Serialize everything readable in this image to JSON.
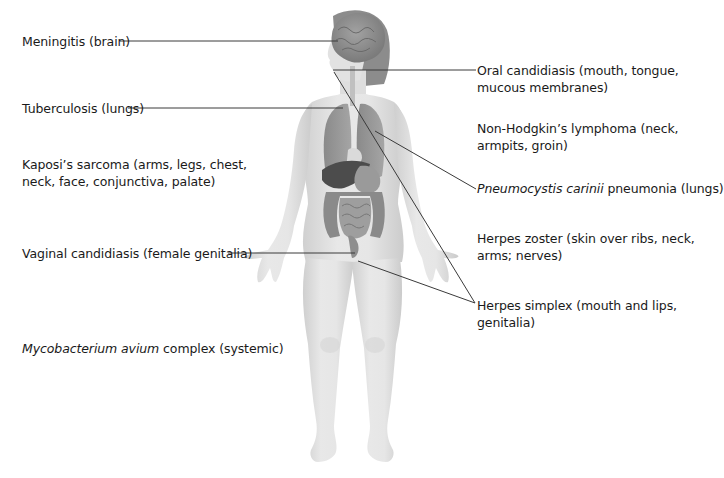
{
  "colors": {
    "background": "#ffffff",
    "text": "#1a1a1a",
    "leader_line": "#3a3a3a",
    "skin": "#e3e3e3",
    "skin_shadow": "#c9c9c9",
    "organ_light": "#9a9a9a",
    "organ_mid": "#7d7d7d",
    "organ_dark": "#4a4a4a",
    "brain": "#8f8f8f",
    "hair": "#8a8a8a"
  },
  "figure": {
    "type": "female-body-front"
  },
  "labels_left": [
    {
      "id": "meningitis",
      "text": "Meningitis (brain)",
      "target": "brain"
    },
    {
      "id": "tuberculosis",
      "text": "Tuberculosis (lungs)",
      "target": "lungs"
    },
    {
      "id": "kaposi",
      "line1": "Kaposi’s sarcoma (arms, legs, chest,",
      "line2": "neck, face, conjunctiva, palate)"
    },
    {
      "id": "vaginal",
      "text": "Vaginal candidiasis (female genitalia)",
      "target": "genitalia"
    },
    {
      "id": "mycobacterium",
      "italic": "Mycobacterium avium",
      "rest": " complex (systemic)"
    }
  ],
  "labels_right": [
    {
      "id": "oral",
      "line1": "Oral candidiasis (mouth, tongue,",
      "line2": "mucous membranes)",
      "target": "mouth"
    },
    {
      "id": "nonhodgkin",
      "line1": "Non-Hodgkin’s lymphoma (neck,",
      "line2": "armpits, groin)"
    },
    {
      "id": "pneumocystis",
      "italic": "Pneumocystis carinii",
      "rest": " pneumonia (lungs)",
      "target": "lungs"
    },
    {
      "id": "zoster",
      "line1": "Herpes zoster (skin over ribs, neck,",
      "line2": "arms; nerves)"
    },
    {
      "id": "simplex",
      "line1": "Herpes simplex (mouth and lips,",
      "line2": "genitalia)",
      "target": "mouth and genitalia"
    }
  ]
}
